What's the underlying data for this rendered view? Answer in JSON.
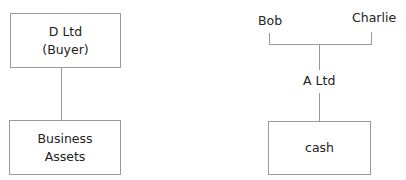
{
  "left_diagram": {
    "top_box": {
      "line1": "D Ltd",
      "line2": "(Buyer)"
    },
    "bottom_box": {
      "line1": "Business",
      "line2": "Assets"
    }
  },
  "right_diagram": {
    "shareholders": [
      {
        "name": "Bob"
      },
      {
        "name": "Charlie"
      }
    ],
    "company": "A Ltd",
    "bottom_box": {
      "label": "cash"
    }
  }
}
